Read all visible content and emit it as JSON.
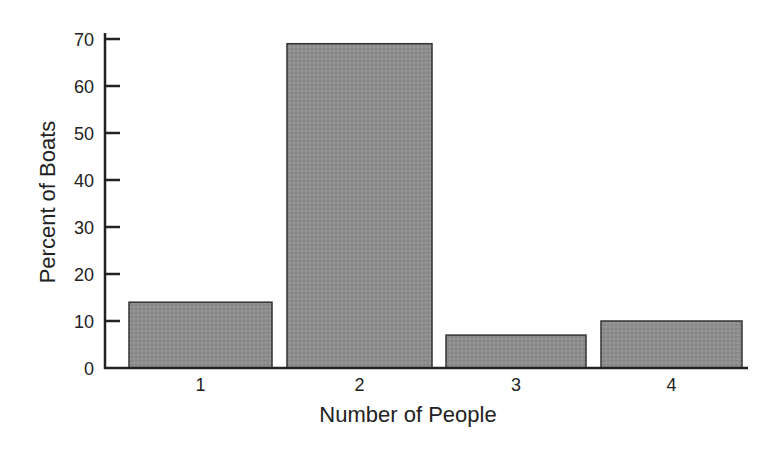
{
  "chart_data": {
    "type": "bar",
    "title": "",
    "xlabel": "Number of People",
    "ylabel": "Percent of Boats",
    "categories": [
      "1",
      "2",
      "3",
      "4"
    ],
    "values": [
      14,
      69,
      7,
      10
    ],
    "ylim": [
      0,
      70
    ],
    "yticks": [
      0,
      10,
      20,
      30,
      40,
      50,
      60,
      70
    ],
    "grid": false,
    "legend": null,
    "bar_color": "#8c8c8c",
    "bar_edge_color": "#333333"
  }
}
